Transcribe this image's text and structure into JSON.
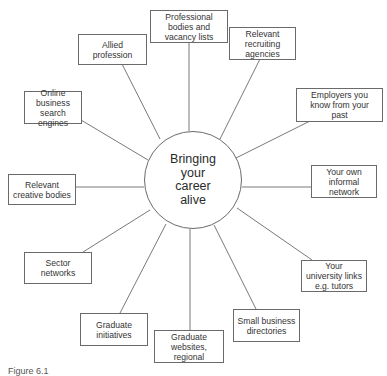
{
  "diagram": {
    "type": "radial-mind-map",
    "center": {
      "label": "Bringing your career alive",
      "lines": [
        "Bringing",
        "your",
        "career",
        "alive"
      ]
    },
    "nodes": [
      {
        "id": "professional-bodies",
        "label": "Professional bodies and vacancy lists"
      },
      {
        "id": "relevant-recruiting",
        "label": "Relevant recruiting agencies"
      },
      {
        "id": "employers-past",
        "label": "Employers you know from your past"
      },
      {
        "id": "informal-network",
        "label": "Your own informal network"
      },
      {
        "id": "university-links",
        "label": "Your university links e.g. tutors"
      },
      {
        "id": "small-business",
        "label": "Small business directories"
      },
      {
        "id": "graduate-websites",
        "label": "Graduate websites, regional"
      },
      {
        "id": "graduate-initiatives",
        "label": "Graduate initiatives"
      },
      {
        "id": "sector-networks",
        "label": "Sector networks"
      },
      {
        "id": "creative-bodies",
        "label": "Relevant creative bodies"
      },
      {
        "id": "online-search",
        "label": "Online business search engines"
      },
      {
        "id": "allied-profession",
        "label": "Allied profession"
      }
    ],
    "caption": "Figure 6.1"
  },
  "colors": {
    "line": "#6a6a6a",
    "text": "#2a2a2a",
    "background": "#ffffff"
  }
}
